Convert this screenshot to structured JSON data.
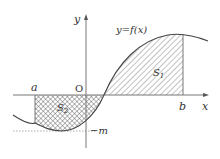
{
  "figure": {
    "type": "area-under-curve diagram",
    "curve_label": "y=f(x)",
    "axis_x_label": "x",
    "axis_y_label": "y",
    "origin_label": "O",
    "point_a_label": "a",
    "point_b_label": "b",
    "min_label": "−m",
    "region_1": {
      "label": "S",
      "subscript": "1",
      "fill": "diagonal hatch",
      "position": "above x-axis, from curve zero to b"
    },
    "region_2": {
      "label": "S",
      "subscript": "2",
      "fill": "cross hatch",
      "position": "below x-axis, from a to curve zero"
    }
  },
  "colors": {
    "axis": "#777777",
    "curve": "#444444",
    "hatch": "#666666",
    "text": "#333333"
  }
}
